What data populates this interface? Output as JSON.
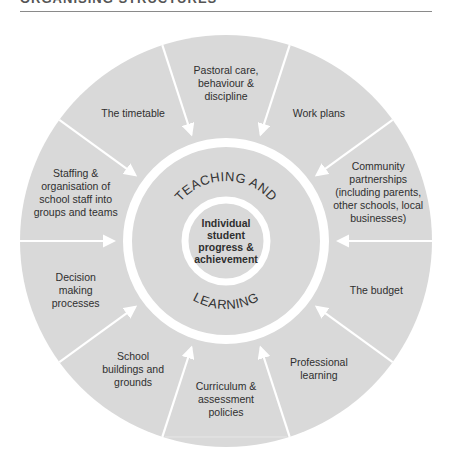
{
  "header": {
    "title": "ORGANISING STRUCTURES"
  },
  "diagram": {
    "colors": {
      "fill": "#d9d9d9",
      "divider": "#ffffff",
      "text": "#2f2f2f"
    },
    "ring_text": {
      "top": "TEACHING AND",
      "bottom": "LEARNING"
    },
    "core": {
      "lines": [
        "Individual",
        "student",
        "progress &",
        "achievement"
      ]
    },
    "segments": [
      {
        "name": "pastoral-care",
        "lines": [
          "Pastoral care,",
          "behaviour &",
          "discipline"
        ]
      },
      {
        "name": "timetable",
        "lines": [
          "The timetable"
        ]
      },
      {
        "name": "staffing",
        "lines": [
          "Staffing &",
          "organisation of",
          "school staff into",
          "groups and teams"
        ]
      },
      {
        "name": "decision-making",
        "lines": [
          "Decision",
          "making",
          "processes"
        ]
      },
      {
        "name": "school-buildings",
        "lines": [
          "School",
          "buildings and",
          "grounds"
        ]
      },
      {
        "name": "curriculum",
        "lines": [
          "Curriculum &",
          "assessment",
          "policies"
        ]
      },
      {
        "name": "professional-learning",
        "lines": [
          "Professional",
          "learning"
        ]
      },
      {
        "name": "budget",
        "lines": [
          "The budget"
        ]
      },
      {
        "name": "community-partnerships",
        "lines": [
          "Community",
          "partnerships",
          "(including parents,",
          "other schools, local",
          "businesses)"
        ]
      },
      {
        "name": "work-plans",
        "lines": [
          "Work plans"
        ]
      }
    ]
  }
}
